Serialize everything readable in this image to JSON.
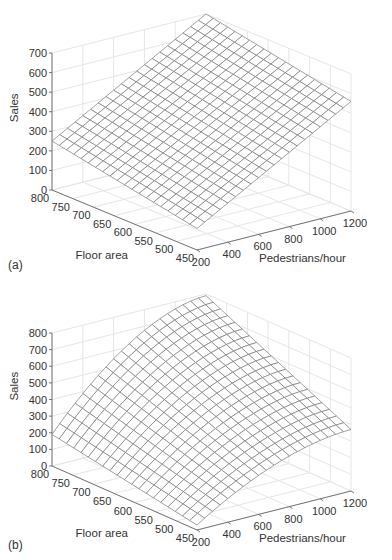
{
  "chart_data": [
    {
      "id": "a",
      "panel_label": "(a)",
      "type": "surface",
      "title": "",
      "xlabel": "Pedestrians/hour",
      "ylabel": "Floor area",
      "zlabel": "Sales",
      "x_ticks": [
        200,
        400,
        600,
        800,
        1000,
        1200
      ],
      "y_ticks": [
        800,
        750,
        700,
        650,
        600,
        550,
        500,
        450
      ],
      "z_ticks": [
        0,
        100,
        200,
        300,
        400,
        500,
        600,
        700
      ],
      "xlim": [
        200,
        1200
      ],
      "ylim": [
        450,
        800
      ],
      "zlim": [
        0,
        700
      ],
      "grid": true,
      "mesh": "linear plane",
      "corners": {
        "x200_y800": 250,
        "x200_y450": 110,
        "x1200_y800": 700,
        "x1200_y450": 560
      }
    },
    {
      "id": "b",
      "panel_label": "(b)",
      "type": "surface",
      "title": "",
      "xlabel": "Pedestrians/hour",
      "ylabel": "Floor area",
      "zlabel": "Sales",
      "x_ticks": [
        200,
        400,
        600,
        800,
        1000,
        1200
      ],
      "y_ticks": [
        800,
        750,
        700,
        650,
        600,
        550,
        500,
        450
      ],
      "z_ticks": [
        0,
        100,
        200,
        300,
        400,
        500,
        600,
        700,
        800
      ],
      "xlim": [
        200,
        1200
      ],
      "ylim": [
        450,
        800
      ],
      "zlim": [
        0,
        800
      ],
      "grid": true,
      "mesh": "curved (concave-down in pedestrians, interaction with floor area)",
      "corners": {
        "x200_y800": 190,
        "x200_y450": 30,
        "x1200_y800": 790,
        "x1200_y450": 370
      }
    }
  ]
}
